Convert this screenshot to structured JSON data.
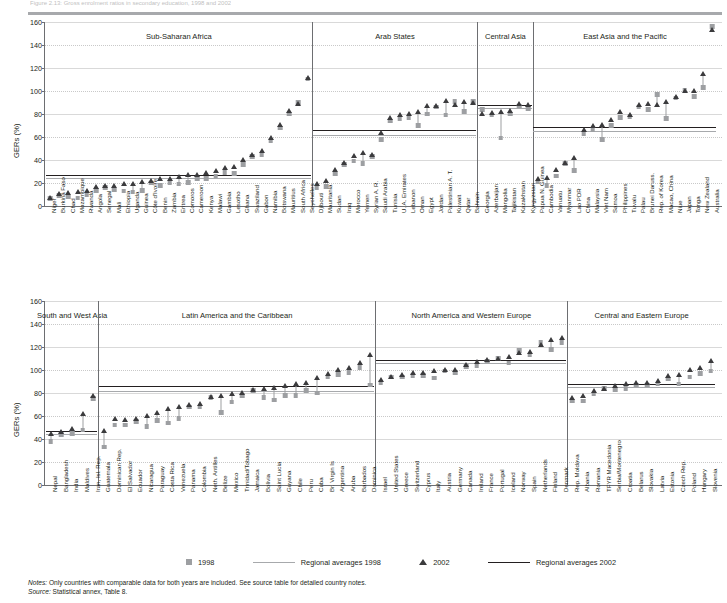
{
  "header": {
    "cut_text": "Figure 2.13: Gross enrolment ratios in secondary education, 1998 and 2002"
  },
  "axis": {
    "y_label": "GERs (%)",
    "y_ticks": [
      0,
      20,
      40,
      60,
      80,
      100,
      120,
      140,
      160
    ],
    "y_min": 0,
    "y_max": 160
  },
  "legend": {
    "items": [
      {
        "name": "marker-1998",
        "label": "1998",
        "type": "square",
        "color": "#9d9fa2"
      },
      {
        "name": "avg-1998",
        "label": "Regional averages 1998",
        "type": "line",
        "color": "#a7a9ac"
      },
      {
        "name": "marker-2002",
        "label": "2002",
        "type": "triangle",
        "color": "#3b3b3d"
      },
      {
        "name": "avg-2002",
        "label": "Regional averages 2002",
        "type": "line",
        "color": "#231f20"
      }
    ]
  },
  "notes": {
    "notes_label": "Notes:",
    "notes_text": "Only countries with comparable data for both years are included. See source table for detailed country notes.",
    "source_label": "Source:",
    "source_text": "Statistical annex, Table 8."
  },
  "chart_data": [
    {
      "type": "scatter",
      "panel": "top",
      "title": "",
      "xlabel": "",
      "ylabel": "GERs (%)",
      "ylim": [
        0,
        160
      ],
      "grid": true,
      "legend_position": "bottom",
      "series": [
        {
          "name": "1998",
          "marker": "square",
          "color": "#9d9fa2"
        },
        {
          "name": "2002",
          "marker": "triangle",
          "color": "#3b3b3d"
        }
      ],
      "regions": [
        {
          "name": "Sub-Saharan Africa",
          "avg_1998": 24.5,
          "avg_2002": 27.0,
          "categories": [
            "Niger",
            "Burkina Faso",
            "Chad",
            "Mozambique",
            "Rwanda",
            "Angola",
            "Senegal",
            "Mali",
            "Ethiopia",
            "Uganda",
            "Guinea",
            "Côte d'Ivoire",
            "Benin",
            "Zambia",
            "Eritrea",
            "Comoros",
            "Cameroon",
            "Kenya",
            "Malawi",
            "Gambia",
            "Lesotho",
            "Ghana",
            "Swaziland",
            "Gabon",
            "Namibia",
            "Botswana",
            "Mauritius",
            "South Africa",
            "Seychelles"
          ],
          "values_1998": [
            6.5,
            9.0,
            8.0,
            7.0,
            10.0,
            13.5,
            16.0,
            14.0,
            13.0,
            12.0,
            13.5,
            20.0,
            18.0,
            20.0,
            19.0,
            20.5,
            23.5,
            24.0,
            26.0,
            29.0,
            28.5,
            36.0,
            43.0,
            45.0,
            57.0,
            68.0,
            80.0,
            90.0,
            110.5
          ],
          "values_2002": [
            6.8,
            10.5,
            12.0,
            12.5,
            13.5,
            16.5,
            17.5,
            18.0,
            19.0,
            19.5,
            21.0,
            22.0,
            23.5,
            24.0,
            25.5,
            27.0,
            27.5,
            29.0,
            31.0,
            33.0,
            34.5,
            40.0,
            45.0,
            48.0,
            59.0,
            71.0,
            83.0,
            89.0,
            112.0
          ]
        },
        {
          "name": "Arab States",
          "avg_1998": 61.5,
          "avg_2002": 66.5,
          "categories": [
            "Djibouti",
            "Mauritania",
            "Sudan",
            "Iraq",
            "Morocco",
            "Yemen",
            "Syrian A. R.",
            "Saudi Arabia",
            "Tunisia",
            "U. A. Emirates",
            "Lebanon",
            "Oman",
            "Egypt",
            "Jordan",
            "Palestinian A. T.",
            "Kuwait",
            "Qatar",
            "Bahrain"
          ],
          "values_1998": [
            16.0,
            17.0,
            28.0,
            36.0,
            39.0,
            37.0,
            43.0,
            58.0,
            74.0,
            76.0,
            77.0,
            70.0,
            80.0,
            86.0,
            79.0,
            91.0,
            82.0,
            91.0
          ],
          "values_2002": [
            19.0,
            22.0,
            32.0,
            38.0,
            44.0,
            46.0,
            45.0,
            64.0,
            77.0,
            79.0,
            80.0,
            82.0,
            87.0,
            87.0,
            92.0,
            88.0,
            91.0,
            90.0
          ]
        },
        {
          "name": "Central Asia",
          "avg_1998": 85.0,
          "avg_2002": 87.5,
          "categories": [
            "Georgia",
            "Azerbaijan",
            "Mongolia",
            "Tajikistan",
            "Kazakhstan",
            "Kyrgyzstan"
          ],
          "values_1998": [
            84.0,
            79.0,
            59.0,
            80.0,
            87.0,
            85.0
          ],
          "values_2002": [
            80.0,
            81.0,
            82.0,
            83.0,
            89.0,
            88.0
          ]
        },
        {
          "name": "East Asia and the Pacific",
          "avg_1998": 65.0,
          "avg_2002": 69.0,
          "categories": [
            "Papua N. Guinea",
            "Cambodia",
            "Vanuatu",
            "Myanmar",
            "Lao PDR",
            "China",
            "Malaysia",
            "Viet Nam",
            "Samoa",
            "Philippines",
            "Tuvalu",
            "Palau",
            "Brunei Daruss.",
            "Rep. of Korea",
            "Macao, China",
            "Niue",
            "Japan",
            "Tonga",
            "New Zealand",
            "Australia"
          ],
          "values_1998": [
            21.0,
            18.0,
            26.0,
            37.0,
            31.0,
            63.0,
            66.0,
            58.0,
            70.0,
            77.0,
            78.0,
            86.0,
            84.0,
            97.0,
            76.0,
            94.0,
            101.0,
            95.0,
            103.0,
            156.0
          ],
          "values_2002": [
            24.0,
            25.0,
            32.0,
            38.0,
            42.0,
            66.0,
            70.0,
            71.0,
            75.0,
            82.0,
            79.0,
            88.0,
            89.0,
            88.0,
            91.0,
            95.0,
            100.0,
            100.0,
            115.0,
            153.0
          ]
        }
      ]
    },
    {
      "type": "scatter",
      "panel": "bottom",
      "title": "",
      "xlabel": "",
      "ylabel": "GERs (%)",
      "ylim": [
        0,
        160
      ],
      "grid": true,
      "legend_position": "bottom",
      "series": [
        {
          "name": "1998",
          "marker": "square",
          "color": "#9d9fa2"
        },
        {
          "name": "2002",
          "marker": "triangle",
          "color": "#3b3b3d"
        }
      ],
      "regions": [
        {
          "name": "South and West Asia",
          "avg_1998": 44.0,
          "avg_2002": 47.0,
          "categories": [
            "Nepal",
            "Bangladesh",
            "India",
            "Maldives",
            "Iran, Isl. Rep."
          ],
          "values_1998": [
            38.0,
            44.0,
            45.0,
            48.0,
            75.0
          ],
          "values_2002": [
            45.0,
            46.0,
            49.0,
            62.0,
            78.0
          ]
        },
        {
          "name": "Latin America and the Caribbean",
          "avg_1998": 82.0,
          "avg_2002": 86.0,
          "categories": [
            "Guatemala",
            "Dominican Rep.",
            "El Salvador",
            "Ecuador",
            "Nicaragua",
            "Paraguay",
            "Costa Rica",
            "Venezuela",
            "Panama",
            "Colombia",
            "Neth. Antilles",
            "Belize",
            "Mexico",
            "Trinidad/Tobago",
            "Jamaica",
            "Bolivia",
            "Saint Lucia",
            "Guyana",
            "Chile",
            "Peru",
            "Cuba",
            "Br. Virgin Is",
            "Argentina",
            "Aruba",
            "Barbados",
            "Dominica"
          ],
          "values_1998": [
            33.0,
            52.0,
            52.0,
            55.0,
            51.0,
            56.0,
            54.0,
            58.0,
            68.0,
            68.0,
            76.0,
            63.0,
            72.0,
            78.0,
            82.0,
            76.0,
            74.0,
            78.0,
            78.0,
            82.0,
            80.0,
            94.0,
            96.0,
            98.0,
            102.0,
            87.0
          ],
          "values_2002": [
            47.0,
            58.0,
            57.0,
            58.0,
            60.0,
            63.0,
            66.0,
            68.0,
            70.0,
            71.0,
            77.0,
            78.0,
            79.0,
            80.0,
            83.0,
            84.0,
            85.0,
            86.0,
            88.0,
            89.0,
            93.0,
            97.0,
            100.0,
            102.0,
            106.0,
            113.0
          ]
        },
        {
          "name": "North America and Western Europe",
          "avg_1998": 106.0,
          "avg_2002": 109.0,
          "categories": [
            "Israel",
            "United States",
            "Greece",
            "Switzerland",
            "Cyprus",
            "Italy",
            "Austria",
            "Germany",
            "Canada",
            "Ireland",
            "France",
            "Portugal",
            "Iceland",
            "Norway",
            "Spain",
            "Netherlands",
            "Finland",
            "Denmark"
          ],
          "values_1998": [
            89.0,
            94.0,
            94.0,
            95.0,
            95.0,
            93.0,
            99.0,
            98.0,
            103.0,
            104.0,
            108.0,
            110.0,
            106.0,
            117.0,
            113.0,
            124.0,
            118.0,
            124.0
          ],
          "values_2002": [
            92.0,
            94.0,
            96.0,
            98.0,
            98.0,
            99.0,
            100.0,
            100.0,
            105.0,
            107.0,
            109.0,
            110.0,
            112.0,
            115.0,
            116.0,
            122.0,
            126.0,
            128.0
          ]
        },
        {
          "name": "Central and Eastern Europe",
          "avg_1998": 85.0,
          "avg_2002": 88.0,
          "categories": [
            "Rep. Moldova",
            "Albania",
            "Romania",
            "TFYR Macedonia",
            "Serbia/Montenegro",
            "Croatia",
            "Belarus",
            "Slovakia",
            "Latvia",
            "Estonia",
            "Czech Rep.",
            "Poland",
            "Hungary",
            "Slovenia"
          ],
          "values_1998": [
            73.0,
            73.0,
            79.0,
            84.0,
            83.0,
            84.0,
            87.0,
            87.0,
            88.0,
            92.0,
            88.0,
            94.0,
            97.0,
            99.0
          ],
          "values_2002": [
            76.0,
            78.0,
            82.0,
            84.0,
            86.0,
            88.0,
            89.0,
            89.0,
            91.0,
            95.0,
            96.0,
            100.0,
            102.0,
            108.0
          ]
        }
      ]
    }
  ]
}
